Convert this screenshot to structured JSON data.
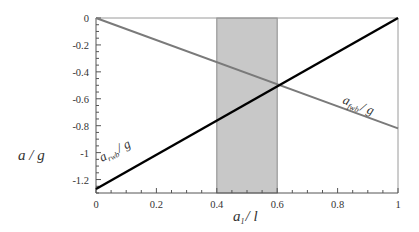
{
  "chart_data": {
    "type": "line",
    "title": "",
    "xlabel": "a1 / l",
    "xlabel_main": "a",
    "xlabel_sub": "1",
    "xlabel_tail": "/ l",
    "ylabel": "a / g",
    "xlim": [
      0,
      1
    ],
    "ylim": [
      -1.3,
      0
    ],
    "x_ticks": [
      "0",
      "0.2",
      "0.4",
      "0.6",
      "0.8",
      "1"
    ],
    "y_ticks": [
      "0",
      "-0.2",
      "-0.4",
      "-0.6",
      "-0.8",
      "-1",
      "-1.2"
    ],
    "grid": false,
    "legend": "inline labels",
    "shaded_region": {
      "x_start": 0.4,
      "x_end": 0.6,
      "color": "#c8c8c8"
    },
    "series": [
      {
        "name": "a_fwb / g",
        "label_main": "a",
        "label_sub": "fwb",
        "label_tail": "/ g",
        "color": "#7a7a7a",
        "x": [
          0,
          1
        ],
        "values": [
          0,
          -0.82
        ]
      },
      {
        "name": "a_rwb / g",
        "label_main": "a",
        "label_sub": "rwb",
        "label_tail": "/ g",
        "color": "#000000",
        "x": [
          0,
          1
        ],
        "values": [
          -1.27,
          0
        ]
      }
    ],
    "intersection": {
      "x": 0.6,
      "y": -0.5
    }
  }
}
